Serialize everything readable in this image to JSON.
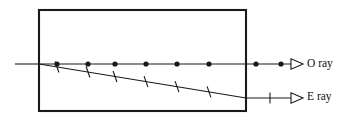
{
  "figure": {
    "canvas": {
      "width": 346,
      "height": 134
    },
    "background_color": "#ffffff",
    "stroke_color": "#1a1a1a",
    "crystal": {
      "label": "crystal-slab",
      "x": 39,
      "y": 10,
      "width": 207,
      "height": 101,
      "stroke_width": 2.1,
      "fill": "#ffffff"
    },
    "incident_ray": {
      "label": "incident-ray",
      "x1": 15,
      "y1": 64,
      "x2": 39,
      "y2": 64,
      "stroke_width": 1.1
    },
    "o_ray": {
      "label": "O ray",
      "text": "O ray",
      "text_x": 307,
      "text_y": 64.5,
      "line_x1": 39,
      "line_y1": 64,
      "line_x2": 291,
      "line_y2": 64,
      "stroke_width": 1.1,
      "marker": "filled-dot",
      "marker_radius": 2.6,
      "marker_xs": [
        57,
        88,
        115,
        146,
        177,
        209,
        256,
        281
      ],
      "arrow_tip_x": 303,
      "arrow_tip_y": 64,
      "arrow_half_height": 5.2,
      "arrow_length": 12
    },
    "e_ray": {
      "label": "E ray",
      "text": "E ray",
      "text_x": 307,
      "text_y": 97.5,
      "slant_x1": 39,
      "slant_y1": 64,
      "slant_x2": 246,
      "slant_y2": 98,
      "flat_x1": 246,
      "flat_y1": 98,
      "flat_x2": 291,
      "flat_y2": 98,
      "stroke_width": 1.1,
      "marker": "tick",
      "tick_length": 11,
      "tick_xs_inside": [
        57,
        88,
        115,
        146,
        177,
        209
      ],
      "tick_xs_outside": [
        270
      ],
      "arrow_tip_x": 303,
      "arrow_tip_y": 98,
      "arrow_half_height": 5.2,
      "arrow_length": 12
    }
  },
  "chart_data": {
    "type": "diagram",
    "elements": [
      {
        "name": "crystal-slab",
        "kind": "rectangle",
        "x": 39,
        "y": 10,
        "width": 207,
        "height": 101
      },
      {
        "name": "incident-ray",
        "kind": "segment",
        "from": [
          15,
          64
        ],
        "to": [
          39,
          64
        ]
      },
      {
        "name": "o-ray",
        "kind": "segment",
        "from": [
          39,
          64
        ],
        "to": [
          303,
          64
        ],
        "polarization_marker": "dot",
        "marker_count": 8
      },
      {
        "name": "e-ray-inside",
        "kind": "segment",
        "from": [
          39,
          64
        ],
        "to": [
          246,
          98
        ],
        "polarization_marker": "tick",
        "marker_count": 6
      },
      {
        "name": "e-ray-outside",
        "kind": "segment",
        "from": [
          246,
          98
        ],
        "to": [
          303,
          98
        ],
        "polarization_marker": "tick",
        "marker_count": 1
      }
    ],
    "annotations": [
      {
        "text": "O ray",
        "x": 307,
        "y": 64
      },
      {
        "text": "E ray",
        "x": 307,
        "y": 98
      }
    ]
  }
}
